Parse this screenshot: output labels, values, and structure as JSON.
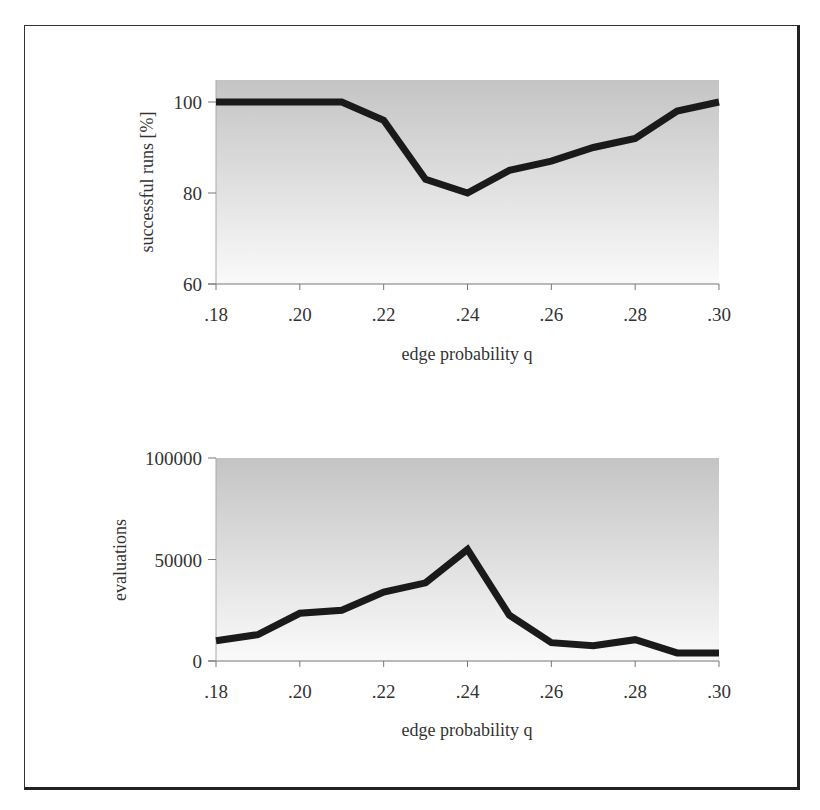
{
  "chart_data": [
    {
      "type": "line",
      "title": "",
      "xlabel": "edge probability q",
      "ylabel": "successful runs [%]",
      "x": [
        0.18,
        0.19,
        0.2,
        0.21,
        0.22,
        0.23,
        0.24,
        0.25,
        0.26,
        0.27,
        0.28,
        0.29,
        0.3
      ],
      "x_tick_labels": [
        ".18",
        ".20",
        ".22",
        ".24",
        ".26",
        ".28",
        ".30"
      ],
      "y_tick_labels": [
        "60",
        "80",
        "100"
      ],
      "series": [
        {
          "name": "successful runs",
          "values": [
            100,
            100,
            100,
            100,
            96,
            83,
            80,
            85,
            87,
            90,
            92,
            98,
            100
          ]
        }
      ],
      "xlim": [
        0.18,
        0.3
      ],
      "ylim": [
        60,
        105
      ],
      "grid": false,
      "legend": "none",
      "background": "vertical gradient gray to white"
    },
    {
      "type": "line",
      "title": "",
      "xlabel": "edge probability q",
      "ylabel": "evaluations",
      "x": [
        0.18,
        0.19,
        0.2,
        0.21,
        0.22,
        0.23,
        0.24,
        0.25,
        0.26,
        0.27,
        0.28,
        0.29,
        0.3
      ],
      "x_tick_labels": [
        ".18",
        ".20",
        ".22",
        ".24",
        ".26",
        ".28",
        ".30"
      ],
      "y_tick_labels": [
        "0",
        "50000",
        "100000"
      ],
      "series": [
        {
          "name": "evaluations",
          "values": [
            10000,
            13000,
            23500,
            25000,
            34000,
            38500,
            55000,
            22500,
            9000,
            7500,
            10500,
            4000,
            4000
          ]
        }
      ],
      "xlim": [
        0.18,
        0.3
      ],
      "ylim": [
        0,
        100000
      ],
      "grid": false,
      "legend": "none",
      "background": "vertical gradient gray to white"
    }
  ],
  "colors": {
    "line": "#1a1a1a",
    "gradient_top": "#c4c4c4",
    "gradient_bottom": "#fafafa",
    "frame": "#222222"
  }
}
